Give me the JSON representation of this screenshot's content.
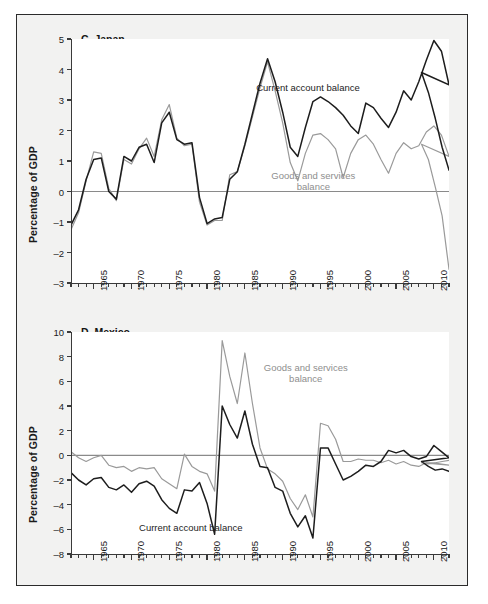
{
  "figure": {
    "background": "#f2f2f1",
    "border_color": "#2b2b2b",
    "series_colors": {
      "current_account": "#1d1d1d",
      "goods_services": "#9a9a9a"
    }
  },
  "chart_data": [
    {
      "type": "line",
      "title": "C. Japan",
      "xlabel": "",
      "ylabel": "Percentage of GDP",
      "xlim": [
        1962,
        2012
      ],
      "ylim": [
        -3,
        5
      ],
      "yticks": [
        -3,
        -2,
        -1,
        0,
        1,
        2,
        3,
        4,
        5
      ],
      "xticks": [
        1965,
        1970,
        1975,
        1980,
        1985,
        1990,
        1995,
        2000,
        2005,
        2010
      ],
      "xtick_labels": [
        "1965",
        "1970",
        "1975",
        "1980",
        "1985",
        "1990",
        "1995",
        "2000",
        "2005",
        "2010"
      ],
      "minor_xtick_step": 1,
      "grid": false,
      "zero_line": true,
      "legend": "inline-annotations",
      "annotations": [
        {
          "text": "Current account balance",
          "color": "#1d1d1d",
          "x": 1986.5,
          "y": 3.6
        },
        {
          "text": "Goods and services balance",
          "color": "#9a9a9a",
          "x": 1988.5,
          "y": 0.72
        }
      ],
      "x": [
        1962,
        1963,
        1964,
        1965,
        1966,
        1967,
        1968,
        1969,
        1970,
        1971,
        1972,
        1973,
        1974,
        1975,
        1976,
        1977,
        1978,
        1979,
        1980,
        1981,
        1982,
        1983,
        1984,
        1985,
        1986,
        1987,
        1988,
        1989,
        1990,
        1991,
        1992,
        1993,
        1994,
        1995,
        1996,
        1997,
        1998,
        1999,
        2000,
        2001,
        2002,
        2003,
        2004,
        2005,
        2006,
        2007,
        2008,
        2009,
        2010,
        2011,
        2012
      ],
      "series": [
        {
          "name": "Current account balance",
          "color": "#1d1d1d",
          "values": [
            -1.1,
            -0.6,
            0.4,
            1.05,
            1.1,
            0.0,
            -0.25,
            1.15,
            1.0,
            1.45,
            1.55,
            0.95,
            2.25,
            2.6,
            1.7,
            1.55,
            1.6,
            -0.2,
            -1.05,
            -0.9,
            -0.85,
            0.4,
            0.65,
            1.55,
            2.55,
            3.55,
            4.35,
            3.6,
            2.6,
            1.45,
            1.15,
            2.1,
            2.95,
            3.1,
            2.95,
            2.75,
            2.5,
            2.15,
            1.9,
            2.9,
            2.75,
            2.4,
            2.1,
            2.6,
            3.3,
            3.0,
            3.6,
            4.3,
            4.95,
            4.6,
            3.5,
            3.9,
            3.25,
            2.4,
            1.45,
            0.7
          ]
        },
        {
          "name": "Goods and services balance",
          "color": "#9a9a9a",
          "values": [
            -1.25,
            -0.7,
            0.35,
            1.3,
            1.25,
            0.1,
            -0.3,
            1.05,
            0.9,
            1.4,
            1.75,
            1.15,
            2.35,
            2.85,
            1.75,
            1.5,
            1.55,
            -0.35,
            -1.1,
            -0.95,
            -0.95,
            0.55,
            0.65,
            1.5,
            2.45,
            3.4,
            4.25,
            3.3,
            2.25,
            0.95,
            0.35,
            1.25,
            1.85,
            1.9,
            1.7,
            1.4,
            0.45,
            1.25,
            1.7,
            1.85,
            1.55,
            1.05,
            0.6,
            1.25,
            1.6,
            1.4,
            1.5,
            1.95,
            2.15,
            1.85,
            1.15,
            1.55,
            1.05,
            0.15,
            -0.8,
            -2.55
          ]
        }
      ]
    },
    {
      "type": "line",
      "title": "D. Mexico",
      "xlabel": "",
      "ylabel": "Percentage of GDP",
      "xlim": [
        1962,
        2012
      ],
      "ylim": [
        -8,
        10
      ],
      "yticks": [
        -8,
        -6,
        -4,
        -2,
        0,
        2,
        4,
        6,
        8,
        10
      ],
      "xticks": [
        1965,
        1970,
        1975,
        1980,
        1985,
        1990,
        1995,
        2000,
        2005,
        2010
      ],
      "xtick_labels": [
        "1965",
        "1970",
        "1975",
        "1980",
        "1985",
        "1990",
        "1995",
        "2000",
        "2005",
        "2010"
      ],
      "minor_xtick_step": 1,
      "grid": false,
      "zero_line": true,
      "legend": "inline-annotations",
      "annotations": [
        {
          "text": "Goods and services balance",
          "color": "#9a9a9a",
          "x": 1987.5,
          "y": 7.6
        },
        {
          "text": "Current account balance",
          "color": "#1d1d1d",
          "x": 1971.0,
          "y": -5.4
        }
      ],
      "x": [
        1962,
        1963,
        1964,
        1965,
        1966,
        1967,
        1968,
        1969,
        1970,
        1971,
        1972,
        1973,
        1974,
        1975,
        1976,
        1977,
        1978,
        1979,
        1980,
        1981,
        1982,
        1983,
        1984,
        1985,
        1986,
        1987,
        1988,
        1989,
        1990,
        1991,
        1992,
        1993,
        1994,
        1995,
        1996,
        1997,
        1998,
        1999,
        2000,
        2001,
        2002,
        2003,
        2004,
        2005,
        2006,
        2007,
        2008,
        2009,
        2010,
        2011,
        2012
      ],
      "series": [
        {
          "name": "Current account balance",
          "color": "#1d1d1d",
          "values": [
            -1.4,
            -2.0,
            -2.4,
            -1.9,
            -1.8,
            -2.6,
            -2.8,
            -2.4,
            -3.0,
            -2.3,
            -2.1,
            -2.5,
            -3.6,
            -4.3,
            -4.7,
            -2.8,
            -2.9,
            -2.2,
            -3.9,
            -6.4,
            4.0,
            2.5,
            1.4,
            3.6,
            0.9,
            -0.9,
            -1.0,
            -2.6,
            -2.9,
            -4.7,
            -5.8,
            -4.9,
            -6.7,
            0.6,
            0.6,
            -0.7,
            -2.0,
            -1.7,
            -1.3,
            -0.8,
            -0.9,
            -0.5,
            0.4,
            0.2,
            0.4,
            -0.1,
            -0.3,
            -0.1,
            0.8,
            0.3,
            -0.2,
            -0.5,
            -0.9,
            -1.2,
            -1.1,
            -1.3
          ]
        },
        {
          "name": "Goods and services balance",
          "color": "#9a9a9a",
          "values": [
            0.3,
            -0.2,
            -0.5,
            -0.2,
            0.0,
            -0.8,
            -1.0,
            -0.9,
            -1.3,
            -1.0,
            -1.1,
            -1.0,
            -1.9,
            -2.3,
            -2.7,
            0.1,
            -0.9,
            -1.3,
            -1.5,
            -2.9,
            9.3,
            6.4,
            4.2,
            8.3,
            4.2,
            0.6,
            -1.1,
            -1.5,
            -2.1,
            -3.5,
            -4.4,
            -3.2,
            -5.0,
            2.6,
            2.4,
            1.3,
            -0.5,
            -0.5,
            -0.3,
            -0.4,
            -0.4,
            -0.6,
            -0.4,
            -0.7,
            -0.5,
            -0.8,
            -0.9,
            -0.6,
            -0.6,
            -0.7,
            -0.8,
            -0.6,
            -0.7,
            -0.6,
            -0.5,
            -0.4
          ]
        }
      ]
    }
  ]
}
